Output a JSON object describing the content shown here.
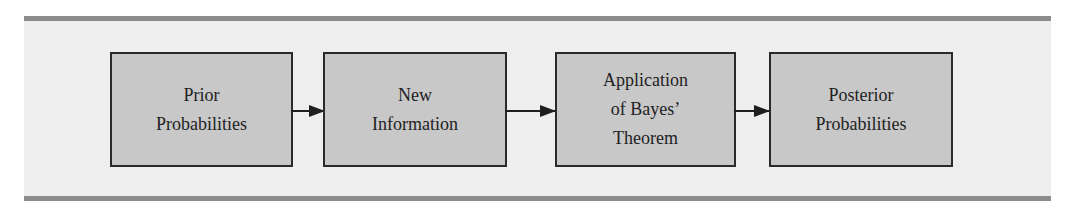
{
  "diagram": {
    "type": "flowchart",
    "direction": "left-to-right",
    "colors": {
      "frame_background": "#eeeeee",
      "frame_bars": "#8c8c8c",
      "box_fill": "#c8c8c8",
      "box_border": "#2a2a2a",
      "arrow": "#1e1e1e",
      "text": "#222222"
    },
    "nodes": [
      {
        "id": "prior",
        "lines": [
          "Prior",
          "Probabilities"
        ]
      },
      {
        "id": "new_info",
        "lines": [
          "New",
          "Information"
        ]
      },
      {
        "id": "bayes",
        "lines": [
          "Application",
          "of Bayes’",
          "Theorem"
        ]
      },
      {
        "id": "posterior",
        "lines": [
          "Posterior",
          "Probabilities"
        ]
      }
    ],
    "edges": [
      {
        "from": "prior",
        "to": "new_info"
      },
      {
        "from": "new_info",
        "to": "bayes"
      },
      {
        "from": "bayes",
        "to": "posterior"
      }
    ]
  }
}
